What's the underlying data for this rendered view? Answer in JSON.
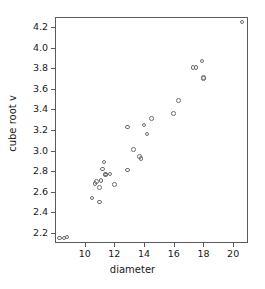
{
  "chart_data": {
    "type": "scatter",
    "title": "",
    "xlabel": "diameter",
    "ylabel": "cube root v",
    "xlim": [
      8.0,
      21.0
    ],
    "ylim": [
      2.1,
      4.3
    ],
    "xticks": [
      10,
      12,
      14,
      16,
      18,
      20
    ],
    "xticklabels": [
      "10",
      "12",
      "14",
      "16",
      "18",
      "20"
    ],
    "yticks": [
      2.2,
      2.4,
      2.6,
      2.8,
      3.0,
      3.2,
      3.4,
      3.6,
      3.8,
      4.0,
      4.2
    ],
    "yticklabels": [
      "2.2",
      "2.4",
      "2.6",
      "2.8",
      "3.0",
      "3.2",
      "3.4",
      "3.6",
      "3.8",
      "4.0",
      "4.2"
    ],
    "grid": false,
    "legend": false,
    "marker": "open-circle",
    "marker_color": "#6e6e6e",
    "frame_color": "#5a5a5a",
    "background": "#ffffff",
    "n_points": 31,
    "points": [
      {
        "x": 8.3,
        "y": 2.15
      },
      {
        "x": 8.6,
        "y": 2.15
      },
      {
        "x": 8.8,
        "y": 2.16
      },
      {
        "x": 10.5,
        "y": 2.54
      },
      {
        "x": 10.7,
        "y": 2.68
      },
      {
        "x": 10.8,
        "y": 2.7
      },
      {
        "x": 11.0,
        "y": 2.5
      },
      {
        "x": 11.0,
        "y": 2.64
      },
      {
        "x": 11.1,
        "y": 2.71
      },
      {
        "x": 11.2,
        "y": 2.82
      },
      {
        "x": 11.3,
        "y": 2.89
      },
      {
        "x": 11.4,
        "y": 2.76
      },
      {
        "x": 11.4,
        "y": 2.77
      },
      {
        "x": 11.7,
        "y": 2.77
      },
      {
        "x": 12.0,
        "y": 2.67
      },
      {
        "x": 12.9,
        "y": 2.81
      },
      {
        "x": 12.9,
        "y": 3.23
      },
      {
        "x": 13.3,
        "y": 3.01
      },
      {
        "x": 13.7,
        "y": 2.94
      },
      {
        "x": 13.8,
        "y": 2.92
      },
      {
        "x": 14.0,
        "y": 3.25
      },
      {
        "x": 14.2,
        "y": 3.16
      },
      {
        "x": 14.5,
        "y": 3.31
      },
      {
        "x": 16.0,
        "y": 3.36
      },
      {
        "x": 16.3,
        "y": 3.49
      },
      {
        "x": 17.3,
        "y": 3.81
      },
      {
        "x": 17.5,
        "y": 3.81
      },
      {
        "x": 17.9,
        "y": 3.87
      },
      {
        "x": 18.0,
        "y": 3.7
      },
      {
        "x": 18.0,
        "y": 3.71
      },
      {
        "x": 20.6,
        "y": 4.25
      }
    ]
  }
}
